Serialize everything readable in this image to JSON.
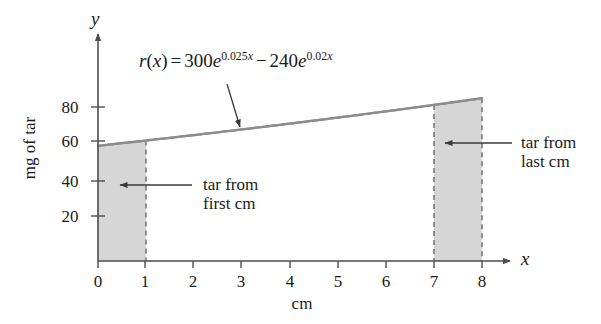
{
  "figure": {
    "title": "",
    "equation": {
      "lhs_fn": "r",
      "lhs_var": "x",
      "equals": "=",
      "coef1": "300",
      "base1": "e",
      "exp1_num": "0.025",
      "exp1_var": "x",
      "operator": "−",
      "coef2": "240",
      "base2": "e",
      "exp2_num": "0.02",
      "exp2_var": "x",
      "plain": "r(x) = 300e^{0.025x} − 240e^{0.02x}"
    },
    "y_axis": {
      "var_label": "y",
      "caption": "mg of tar",
      "ticks": [
        "20",
        "40",
        "60",
        "80"
      ]
    },
    "x_axis": {
      "var_label": "x",
      "caption": "cm",
      "ticks": [
        "0",
        "1",
        "2",
        "3",
        "4",
        "5",
        "6",
        "7",
        "8"
      ]
    },
    "annotations": [
      {
        "line1": "tar from",
        "line2": "first cm"
      },
      {
        "line1": "tar from",
        "line2": "last cm"
      }
    ],
    "colors": {
      "shade_fill": "#d6d6d6",
      "shade_stroke": "#9a9a9a",
      "curve": "#8c8c8c",
      "axis": "#4d4d4d",
      "text": "#1a1a1a"
    }
  },
  "chart_data": {
    "type": "line",
    "title": "",
    "xlabel": "cm",
    "ylabel": "mg of tar",
    "xlim": [
      0,
      8
    ],
    "ylim": [
      0,
      100
    ],
    "xticks": [
      0,
      1,
      2,
      3,
      4,
      5,
      6,
      7,
      8
    ],
    "yticks": [
      20,
      40,
      60,
      80
    ],
    "grid": false,
    "legend": null,
    "function": "r(x) = 300*exp(0.025x) - 240*exp(0.02x)",
    "series": [
      {
        "name": "r(x)",
        "x": [
          0,
          1,
          2,
          3,
          4,
          5,
          6,
          7,
          8
        ],
        "values": [
          60.0,
          62.75,
          65.58,
          68.49,
          71.48,
          74.55,
          77.71,
          80.95,
          84.29
        ]
      }
    ],
    "shaded_regions": [
      {
        "label": "tar from first cm",
        "x_start": 0,
        "x_end": 1
      },
      {
        "label": "tar from last cm",
        "x_start": 7,
        "x_end": 8
      }
    ],
    "annotations": [
      {
        "text": "r(x) = 300e^{0.025x} − 240e^{0.02x}",
        "points_to": [
          3.0,
          67.0
        ]
      },
      {
        "text": "tar from first cm",
        "points_to": [
          0.5,
          40.0
        ]
      },
      {
        "text": "tar from last cm",
        "points_to": [
          7.5,
          62.0
        ]
      }
    ]
  }
}
